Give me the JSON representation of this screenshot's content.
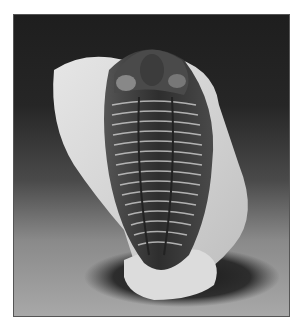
{
  "image": {
    "subject": "Trilobite fossil on matrix rock",
    "alt": "Black and white photograph of a trilobite fossil with segmented thorax resting on a pale rock, casting a dark shadow on a gray background",
    "colors": {
      "background_top": "#1e1e1e",
      "background_bottom": "#a8a8a8",
      "rock": "#d8d8d8",
      "fossil": "#3a3a3a",
      "shadow": "#1a1a1a",
      "border": "#555555"
    }
  }
}
